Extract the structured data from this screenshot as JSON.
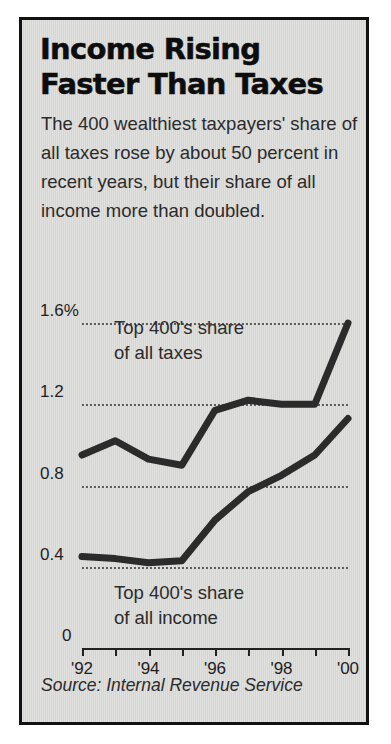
{
  "panel": {
    "headline": "Income Rising\nFaster Than Taxes",
    "deck": "The 400 wealthiest taxpayers' share of all taxes rose by about 50 percent in recent years, but their share of all income more than doubled.",
    "source": "Source: Internal Revenue Service",
    "background_color": "#d9d9d6",
    "border_color": "#111111",
    "line_color": "#2b2b2b"
  },
  "chart_data": {
    "type": "line",
    "title": "Income Rising Faster Than Taxes",
    "subtitle": "The 400 wealthiest taxpayers' share of all taxes rose by about 50 percent in recent years, but their share of all income more than doubled.",
    "xlabel": "",
    "ylabel": "",
    "unit": "percent",
    "x": [
      1992,
      1993,
      1994,
      1995,
      1996,
      1997,
      1998,
      1999,
      2000
    ],
    "xtick_labels": [
      "'92",
      "'94",
      "'96",
      "'98",
      "'00"
    ],
    "xtick_values": [
      1992,
      1994,
      1996,
      1998,
      2000
    ],
    "ytick_labels": [
      "1.6%",
      "1.2",
      "0.8",
      "0.4",
      "0"
    ],
    "ytick_values": [
      1.6,
      1.2,
      0.8,
      0.4,
      0
    ],
    "ylim": [
      0,
      1.6
    ],
    "grid": "horizontal-dotted",
    "legend": "inline-annotations",
    "series": [
      {
        "name": "Top 400's share of all taxes",
        "annotation": "Top 400's share\nof all taxes",
        "values": [
          0.95,
          1.02,
          0.93,
          0.9,
          1.17,
          1.22,
          1.2,
          1.2,
          1.6
        ]
      },
      {
        "name": "Top 400's share of all income",
        "annotation": "Top 400's share\nof all income",
        "values": [
          0.45,
          0.44,
          0.42,
          0.43,
          0.63,
          0.77,
          0.85,
          0.95,
          1.13
        ]
      }
    ]
  }
}
